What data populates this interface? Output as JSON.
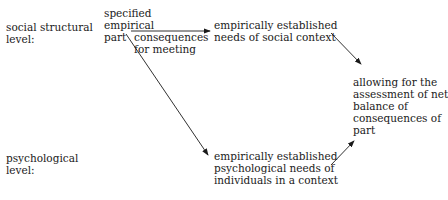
{
  "levels": {
    "social": "social structural\nlevel:",
    "psychological": "psychological\nlevel:"
  },
  "nodes": {
    "part": "specified\nempirical\npart",
    "social_needs": "empirically established\nneeds of social context",
    "psych_needs": "empirically established\npsychological needs of\nindividuals in a context",
    "assessment": "allowing for the\nassessment of net\nbalance of\nconsequences of\npart"
  },
  "edges": {
    "part_to_social_label": "consequences\nfor meeting"
  }
}
